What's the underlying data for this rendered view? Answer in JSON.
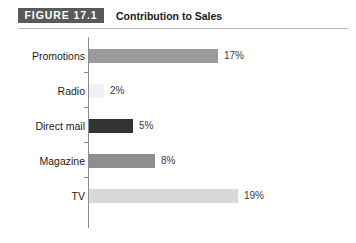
{
  "figure": {
    "badge_label": "FIGURE 17.1",
    "title": "Contribution to Sales",
    "rule_color": "#b8b8b8",
    "badge_color": "#595959",
    "background": "#ffffff"
  },
  "chart_data": {
    "type": "bar",
    "orientation": "horizontal",
    "title": "Contribution to Sales",
    "xlabel": "",
    "ylabel": "",
    "grid": false,
    "legend": false,
    "axis_line": true,
    "categories": [
      "Promotions",
      "Radio",
      "Direct mail",
      "Magazine",
      "TV"
    ],
    "values": [
      17,
      2,
      5,
      8,
      19
    ],
    "value_labels": [
      "17%",
      "2%",
      "5%",
      "8%",
      "19%"
    ],
    "bar_colors": [
      "#9a9a9a",
      "#f1f1f1",
      "#333333",
      "#8e8e8e",
      "#d8d8d8"
    ],
    "bar_pixel_lengths": [
      129,
      15,
      44,
      66,
      149
    ],
    "bars": [
      {
        "category": "Promotions",
        "value": 17,
        "label": "17%",
        "color": "#9a9a9a",
        "length": 129
      },
      {
        "category": "Radio",
        "value": 2,
        "label": "2%",
        "color": "#f1f1f1",
        "length": 15
      },
      {
        "category": "Direct mail",
        "value": 5,
        "label": "5%",
        "color": "#333333",
        "length": 44
      },
      {
        "category": "Magazine",
        "value": 8,
        "label": "8%",
        "color": "#8e8e8e",
        "length": 66
      },
      {
        "category": "TV",
        "value": 19,
        "label": "19%",
        "color": "#d8d8d8",
        "length": 149
      }
    ]
  }
}
